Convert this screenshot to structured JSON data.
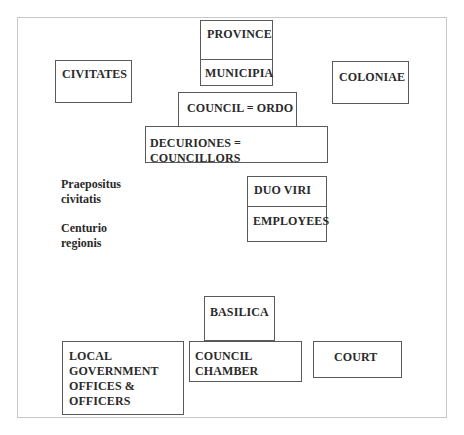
{
  "diagram": {
    "nodes": {
      "province": "PROVINCE",
      "municipia": "MUNICIPIA",
      "civitates": "CIVITATES",
      "coloniae": "COLONIAE",
      "council_ordo": "COUNCIL = ORDO",
      "decuriones": "DECURIONES = COUNCILLORS",
      "duo_viri": "DUO  VIRI",
      "employees": "EMPLOYEES",
      "basilica": "BASILICA",
      "local_government": "LOCAL\nGOVERNMENT\nOFFICES &\nOFFICERS",
      "council_chamber": "COUNCIL\nCHAMBER",
      "court": "COURT"
    },
    "labels": {
      "praepositus": "Praepositus\ncivitatis",
      "centurio": "Centurio\nregionis"
    }
  }
}
